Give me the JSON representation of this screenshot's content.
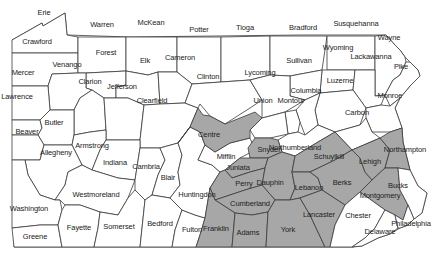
{
  "map": {
    "title": "Pennsylvania Counties",
    "colors": {
      "shaded": "#a7a7a7",
      "unshaded": "#ffffff",
      "border": "#3a3a3a",
      "text": "#222222"
    },
    "counties": [
      {
        "name": "Erie",
        "x": 44,
        "y": 13,
        "shaded": false
      },
      {
        "name": "Crawford",
        "x": 37,
        "y": 42,
        "shaded": false
      },
      {
        "name": "Warren",
        "x": 102,
        "y": 25,
        "shaded": false
      },
      {
        "name": "McKean",
        "x": 151,
        "y": 23,
        "shaded": false
      },
      {
        "name": "Potter",
        "x": 199,
        "y": 30,
        "shaded": false
      },
      {
        "name": "Tioga",
        "x": 245,
        "y": 28,
        "shaded": false
      },
      {
        "name": "Bradford",
        "x": 303,
        "y": 28,
        "shaded": false
      },
      {
        "name": "Susquehanna",
        "x": 356,
        "y": 24,
        "shaded": false
      },
      {
        "name": "Wayne",
        "x": 389,
        "y": 38,
        "shaded": false
      },
      {
        "name": "Forest",
        "x": 106,
        "y": 53,
        "shaded": false
      },
      {
        "name": "Elk",
        "x": 145,
        "y": 61,
        "shaded": false
      },
      {
        "name": "Cameron",
        "x": 180,
        "y": 58,
        "shaded": false
      },
      {
        "name": "Wyoming",
        "x": 338,
        "y": 48,
        "shaded": false
      },
      {
        "name": "Lackawanna",
        "x": 371,
        "y": 57,
        "shaded": false
      },
      {
        "name": "Sullivan",
        "x": 299,
        "y": 61,
        "shaded": false
      },
      {
        "name": "Pike",
        "x": 401,
        "y": 67,
        "shaded": false
      },
      {
        "name": "Mercer",
        "x": 23,
        "y": 73,
        "shaded": false
      },
      {
        "name": "Venango",
        "x": 67,
        "y": 65,
        "shaded": false
      },
      {
        "name": "Clarion",
        "x": 90,
        "y": 82,
        "shaded": false
      },
      {
        "name": "Jefferson",
        "x": 122,
        "y": 87,
        "shaded": false
      },
      {
        "name": "Clinton",
        "x": 208,
        "y": 77,
        "shaded": false
      },
      {
        "name": "Lycoming",
        "x": 260,
        "y": 73,
        "shaded": false
      },
      {
        "name": "Luzerne",
        "x": 340,
        "y": 81,
        "shaded": false
      },
      {
        "name": "Lawrence",
        "x": 17,
        "y": 97,
        "shaded": false
      },
      {
        "name": "Clearfield",
        "x": 152,
        "y": 101,
        "shaded": false
      },
      {
        "name": "Montour",
        "x": 291,
        "y": 101,
        "shaded": false
      },
      {
        "name": "Columbia",
        "x": 306,
        "y": 91,
        "shaded": false
      },
      {
        "name": "Union",
        "x": 263,
        "y": 101,
        "shaded": false
      },
      {
        "name": "Monroe",
        "x": 390,
        "y": 96,
        "shaded": false
      },
      {
        "name": "Butler",
        "x": 54,
        "y": 123,
        "shaded": false
      },
      {
        "name": "Armstrong",
        "x": 92,
        "y": 146,
        "shaded": false
      },
      {
        "name": "Centre",
        "x": 209,
        "y": 135,
        "shaded": true
      },
      {
        "name": "Carbon",
        "x": 357,
        "y": 113,
        "shaded": false
      },
      {
        "name": "Snyder",
        "x": 269,
        "y": 150,
        "shaded": true
      },
      {
        "name": "Northumberland",
        "x": 295,
        "y": 148,
        "shaded": false
      },
      {
        "name": "Northampton",
        "x": 405,
        "y": 150,
        "shaded": true
      },
      {
        "name": "Beaver",
        "x": 27,
        "y": 132,
        "shaded": false
      },
      {
        "name": "Mifflin",
        "x": 226,
        "y": 157,
        "shaded": false
      },
      {
        "name": "Schuylkill",
        "x": 329,
        "y": 157,
        "shaded": true
      },
      {
        "name": "Lehigh",
        "x": 370,
        "y": 162,
        "shaded": true
      },
      {
        "name": "Allegheny",
        "x": 56,
        "y": 153,
        "shaded": false
      },
      {
        "name": "Indiana",
        "x": 115,
        "y": 163,
        "shaded": false
      },
      {
        "name": "Cambria",
        "x": 146,
        "y": 167,
        "shaded": false
      },
      {
        "name": "Juniata",
        "x": 238,
        "y": 168,
        "shaded": true
      },
      {
        "name": "Dauphin",
        "x": 270,
        "y": 183,
        "shaded": true
      },
      {
        "name": "Lebanon",
        "x": 309,
        "y": 188,
        "shaded": true
      },
      {
        "name": "Berks",
        "x": 342,
        "y": 183,
        "shaded": true
      },
      {
        "name": "Blair",
        "x": 168,
        "y": 178,
        "shaded": false
      },
      {
        "name": "Perry",
        "x": 244,
        "y": 184,
        "shaded": true
      },
      {
        "name": "Westmoreland",
        "x": 96,
        "y": 195,
        "shaded": false
      },
      {
        "name": "Bucks",
        "x": 398,
        "y": 186,
        "shaded": false
      },
      {
        "name": "Huntingdon",
        "x": 197,
        "y": 195,
        "shaded": false
      },
      {
        "name": "Montgomery",
        "x": 380,
        "y": 196,
        "shaded": true
      },
      {
        "name": "Cumberland",
        "x": 250,
        "y": 204,
        "shaded": true
      },
      {
        "name": "Lancaster",
        "x": 319,
        "y": 215,
        "shaded": true
      },
      {
        "name": "Washington",
        "x": 29,
        "y": 209,
        "shaded": false
      },
      {
        "name": "Chester",
        "x": 358,
        "y": 216,
        "shaded": false
      },
      {
        "name": "Somerset",
        "x": 119,
        "y": 227,
        "shaded": false
      },
      {
        "name": "Bedford",
        "x": 160,
        "y": 224,
        "shaded": false
      },
      {
        "name": "Philadelphia",
        "x": 411,
        "y": 224,
        "shaded": false
      },
      {
        "name": "Fayette",
        "x": 79,
        "y": 228,
        "shaded": false
      },
      {
        "name": "Fulton",
        "x": 192,
        "y": 230,
        "shaded": false
      },
      {
        "name": "Franklin",
        "x": 216,
        "y": 229,
        "shaded": true
      },
      {
        "name": "Adams",
        "x": 248,
        "y": 233,
        "shaded": true
      },
      {
        "name": "York",
        "x": 288,
        "y": 230,
        "shaded": true
      },
      {
        "name": "Delaware",
        "x": 380,
        "y": 232,
        "shaded": false
      },
      {
        "name": "Greene",
        "x": 35,
        "y": 237,
        "shaded": false
      }
    ]
  }
}
